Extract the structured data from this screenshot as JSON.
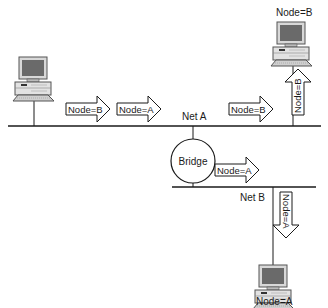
{
  "diagram": {
    "networks": [
      {
        "id": "net-a",
        "label": "Net A"
      },
      {
        "id": "net-b",
        "label": "Net B"
      }
    ],
    "bridge": {
      "label": "Bridge"
    },
    "nodes": [
      {
        "id": "source",
        "label": ""
      },
      {
        "id": "node-b",
        "label": "Node=B"
      },
      {
        "id": "node-a",
        "label": "Node=A"
      }
    ],
    "packets": [
      {
        "id": "pkt-1",
        "label": "Node=B",
        "direction": "right",
        "segment": "Net A"
      },
      {
        "id": "pkt-2",
        "label": "Node=A",
        "direction": "right",
        "segment": "Net A"
      },
      {
        "id": "pkt-3",
        "label": "Node=B",
        "direction": "right",
        "segment": "Net A"
      },
      {
        "id": "pkt-4",
        "label": "Node=B",
        "direction": "up",
        "segment": "to Node=B"
      },
      {
        "id": "pkt-5",
        "label": "Node=A",
        "direction": "right",
        "segment": "Net B"
      },
      {
        "id": "pkt-6",
        "label": "Node=A",
        "direction": "down",
        "segment": "to Node=A"
      }
    ]
  }
}
